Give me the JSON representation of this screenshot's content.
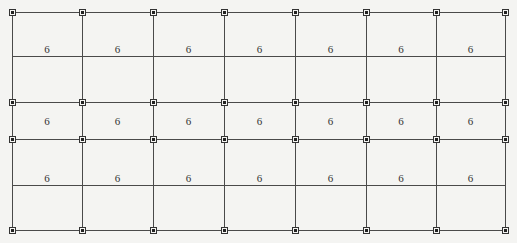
{
  "diagram": {
    "type": "structural-grid-plan",
    "columns_x": [
      12,
      82,
      153,
      224,
      295,
      366,
      436,
      505
    ],
    "horizontal_lines_y": [
      12,
      56,
      102,
      139,
      185,
      230
    ],
    "node_rows_y": [
      12,
      102,
      139,
      230
    ],
    "label_rows": [
      {
        "y": 49,
        "labels": [
          "6",
          "6",
          "6",
          "6",
          "6",
          "6",
          "6"
        ]
      },
      {
        "y": 121,
        "labels": [
          "6",
          "6",
          "6",
          "6",
          "6",
          "6",
          "6"
        ]
      },
      {
        "y": 178,
        "labels": [
          "6",
          "6",
          "6",
          "6",
          "6",
          "6",
          "6"
        ]
      }
    ],
    "colors": {
      "line": "#4a4a4a",
      "node": "#222222",
      "background": "#f4f4f2",
      "text": "#333333"
    }
  }
}
